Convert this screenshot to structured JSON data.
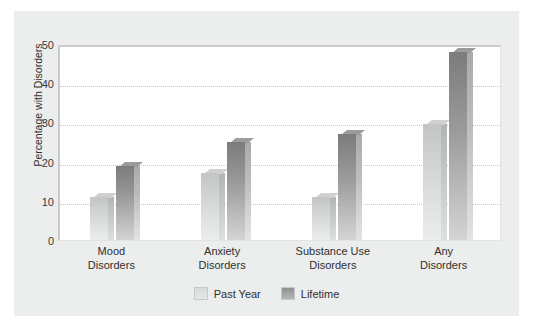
{
  "chart_data": {
    "type": "bar",
    "title": "",
    "xlabel": "",
    "ylabel": "Percentage with Disorders",
    "categories": [
      "Mood\nDisorders",
      "Anxiety\nDisorders",
      "Substance Use\nDisorders",
      "Any\nDisorders"
    ],
    "category_lines": [
      [
        "Mood",
        "Disorders"
      ],
      [
        "Anxiety",
        "Disorders"
      ],
      [
        "Substance Use",
        "Disorders"
      ],
      [
        "Any",
        "Disorders"
      ]
    ],
    "series": [
      {
        "name": "Past Year",
        "color": "#d4d5d5",
        "values": [
          11,
          17,
          11,
          29.5
        ]
      },
      {
        "name": "Lifetime",
        "color": "#8a8c8c",
        "values": [
          19,
          25,
          27,
          48
        ]
      }
    ],
    "ylim": [
      0,
      50
    ],
    "yticks": [
      0,
      10,
      20,
      30,
      40,
      50
    ],
    "ytick_labels": [
      "0",
      "10",
      "20",
      "30",
      "40",
      "50"
    ],
    "grid": true,
    "grid_color": "#d7b9b9",
    "legend_position": "bottom-center",
    "panel_background": "#eceded",
    "plot_background": "#ffffff"
  }
}
